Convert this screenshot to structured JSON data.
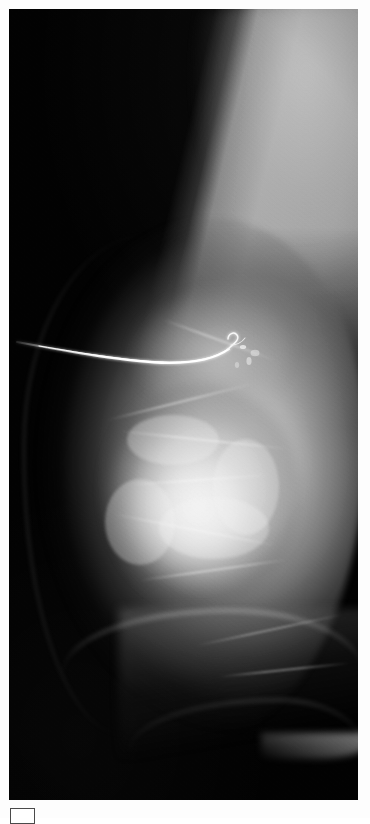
{
  "page": {
    "background_color": "#fdfdfd",
    "width": 370,
    "height": 818
  },
  "radiograph": {
    "name": "mammogram-mlo-view",
    "modality_label": "",
    "frame": {
      "x": 9,
      "y": 9,
      "width": 349,
      "height": 791
    },
    "background_color": "#030303",
    "laterality_hint": "",
    "annotations": []
  },
  "findings": {
    "localization_wire": {
      "label": "",
      "entry_point": {
        "x": 18,
        "y": 345
      },
      "tip_point": {
        "x": 228,
        "y": 344
      },
      "color": "#f2f2f2"
    },
    "dense_mass": {
      "label": "",
      "center": {
        "x": 190,
        "y": 490
      },
      "radius": 105
    },
    "pectoral_muscle": {
      "label": "",
      "color": "#bdbdbd"
    }
  },
  "caption": {
    "marker_label": "",
    "text": ""
  }
}
